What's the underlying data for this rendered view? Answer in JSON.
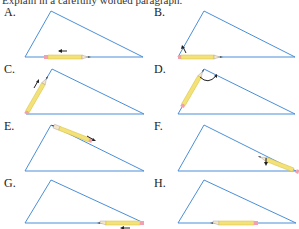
{
  "caption": "Explain in a carefully worded paragraph.",
  "colors": {
    "triangle": "#4a8fd8",
    "pencil_body": "#f3e27a",
    "pencil_edge": "#d9bf3a",
    "eraser": "#f2a0b0",
    "wood": "#f5e6c8",
    "lead": "#333333",
    "arrow": "#222222"
  },
  "panels": [
    {
      "label": "A.",
      "description": "pencil lying on bottom side, arrow pointing left"
    },
    {
      "label": "B.",
      "description": "pencil at bottom-left vertex, arrow rotating up"
    },
    {
      "label": "C.",
      "description": "pencil along left side, arrow pointing toward apex"
    },
    {
      "label": "D.",
      "description": "pencil along left side at apex, curved arrow rotating"
    },
    {
      "label": "E.",
      "description": "pencil along right side from apex, arrow pointing down-right"
    },
    {
      "label": "F.",
      "description": "pencil at bottom-right region of right side, arrow pointing down"
    },
    {
      "label": "G.",
      "description": "pencil at bottom-right vertex on bottom side, arrow pointing left"
    },
    {
      "label": "H.",
      "description": "pencil on bottom side pointing left"
    }
  ]
}
